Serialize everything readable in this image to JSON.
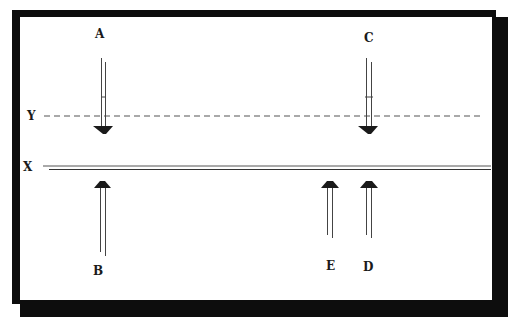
{
  "diagram": {
    "lines": {
      "y": {
        "label": "Y",
        "style": "dashed"
      },
      "x": {
        "label": "X",
        "style": "double"
      }
    },
    "arrows": [
      {
        "id": "A",
        "label": "A",
        "direction": "down",
        "target_line": "Y"
      },
      {
        "id": "C",
        "label": "C",
        "direction": "down",
        "target_line": "Y"
      },
      {
        "id": "B",
        "label": "B",
        "direction": "up",
        "target_line": "X"
      },
      {
        "id": "E",
        "label": "E",
        "direction": "up",
        "target_line": "X"
      },
      {
        "id": "D",
        "label": "D",
        "direction": "up",
        "target_line": "X"
      }
    ],
    "colors": {
      "frame": "#0d0d0d",
      "ink": "#1a1a1a",
      "line": "#555555",
      "background": "#ffffff"
    }
  }
}
